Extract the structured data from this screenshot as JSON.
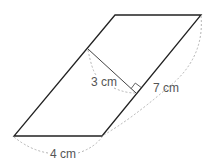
{
  "figure": {
    "shape": "parallelogram",
    "labels": {
      "height": "3 cm",
      "side": "7 cm",
      "base": "4 cm"
    },
    "colors": {
      "outline": "#222222",
      "height_line": "#444444",
      "dashed": "#aaaaaa",
      "text": "#555555"
    }
  }
}
